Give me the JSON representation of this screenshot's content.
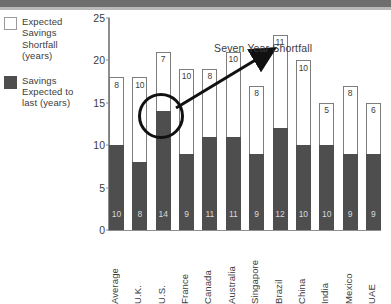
{
  "legend": {
    "items": [
      {
        "swatch": "empty-swatch",
        "label": "Expected Savings Shortfall (years)"
      },
      {
        "swatch": "filled-swatch",
        "label": "Savings Expected to last (years)"
      }
    ]
  },
  "annotation": {
    "label": "Seven Year Shortfall",
    "highlighted_value": "7",
    "highlighted_category": "U.S."
  },
  "chart_data": {
    "type": "bar",
    "stacked": true,
    "title": "",
    "xlabel": "",
    "ylabel": "",
    "ylim": [
      0,
      25
    ],
    "yticks": [
      0,
      5,
      10,
      15,
      20,
      25
    ],
    "grid": false,
    "legend_position": "left",
    "categories": [
      "Average",
      "U.K.",
      "U.S.",
      "France",
      "Canada",
      "Australia",
      "Singapore",
      "Brazil",
      "China",
      "India",
      "Mexico",
      "UAE"
    ],
    "series": [
      {
        "name": "Savings Expected to last (years)",
        "color": "#4e4e4e",
        "values": [
          10,
          8,
          14,
          9,
          11,
          11,
          9,
          12,
          10,
          10,
          9,
          9
        ]
      },
      {
        "name": "Expected Savings Shortfall (years)",
        "color": "#ffffff",
        "values": [
          8,
          10,
          7,
          10,
          8,
          10,
          8,
          11,
          10,
          5,
          8,
          6
        ]
      }
    ],
    "totals": [
      18,
      18,
      21,
      19,
      19,
      21,
      17,
      23,
      20,
      15,
      17,
      15
    ]
  }
}
